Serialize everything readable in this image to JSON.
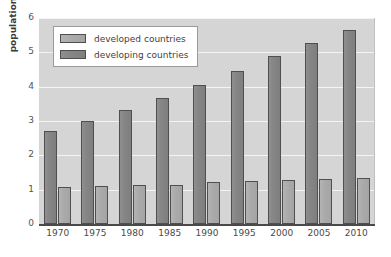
{
  "chart_data": {
    "type": "bar",
    "title": "",
    "xlabel": "",
    "ylabel": "population (billions)",
    "categories": [
      "1970",
      "1975",
      "1980",
      "1985",
      "1990",
      "1995",
      "2000",
      "2005",
      "2010"
    ],
    "series": [
      {
        "name": "developing countries",
        "color": "#868686",
        "values": [
          2.7,
          3.0,
          3.32,
          3.68,
          4.05,
          4.45,
          4.88,
          5.27,
          5.65
        ]
      },
      {
        "name": "developed countries",
        "color": "#ababab",
        "values": [
          1.08,
          1.1,
          1.14,
          1.15,
          1.22,
          1.24,
          1.28,
          1.31,
          1.33
        ]
      }
    ],
    "ylim": [
      0,
      6
    ],
    "yticks": [
      "0",
      "1",
      "2",
      "3",
      "4",
      "5",
      "6"
    ],
    "grid": true,
    "grid_axis": "y",
    "legend_position": "upper left",
    "bar_order_in_group": [
      "developing countries",
      "developed countries"
    ],
    "plot_background": "#d5d5d5",
    "gridline_color": "#f4f4f4"
  },
  "legend": {
    "entries": [
      {
        "label": "developed countries",
        "swatch": "developed"
      },
      {
        "label": "developing countries",
        "swatch": "developing"
      }
    ]
  }
}
